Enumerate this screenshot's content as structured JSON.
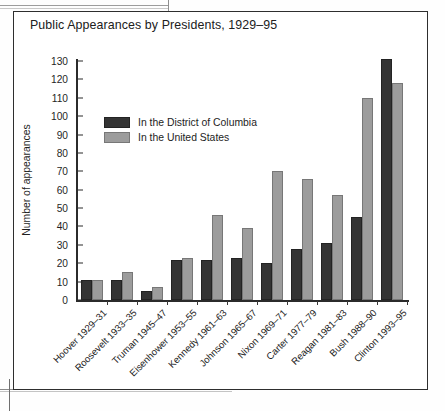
{
  "page": {
    "background": "#fefefe",
    "frame_color": "#2e2e2e"
  },
  "legend": {
    "dc_label": "In the District of Columbia",
    "us_label": "In the United States"
  },
  "colors": {
    "district": "#343434",
    "united_states": "#9c9c9c",
    "axis": "#2b2b2b",
    "text": "#1c1c1c"
  },
  "chart_data": {
    "type": "bar",
    "title": "Public Appearances by Presidents, 1929–95",
    "xlabel": "",
    "ylabel": "Number of appearances",
    "ylim": [
      0,
      130
    ],
    "yticks": [
      0,
      10,
      20,
      30,
      40,
      50,
      60,
      70,
      80,
      90,
      100,
      110,
      120,
      130
    ],
    "grid": false,
    "legend_position": "upper-left-inside",
    "categories": [
      "Hoover 1929–31",
      "Roosevelt 1933–35",
      "Truman 1945–47",
      "Eisenhower 1953–55",
      "Kennedy 1961–63",
      "Johnson 1965–67",
      "Nixon 1969–71",
      "Carter 1977–79",
      "Reagan 1981–83",
      "Bush 1988–90",
      "Clinton 1993–95"
    ],
    "series": [
      {
        "name": "In the District of Columbia",
        "color": "#343434",
        "values": [
          11,
          11,
          5,
          22,
          22,
          23,
          20,
          28,
          31,
          45,
          131
        ]
      },
      {
        "name": "In the United States",
        "color": "#9c9c9c",
        "values": [
          11,
          15,
          7,
          23,
          46,
          39,
          70,
          66,
          57,
          110,
          118
        ]
      }
    ]
  }
}
